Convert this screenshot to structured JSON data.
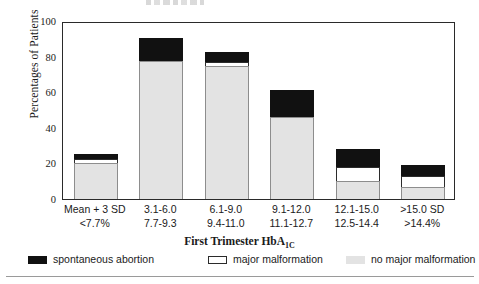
{
  "chart_data": {
    "type": "bar",
    "subtype": "stacked-bar",
    "title": "",
    "xlabel": "First Trimester HbA1C",
    "ylabel": "Percentages of Patients",
    "ylim": [
      0,
      100
    ],
    "yticks": [
      0,
      20,
      40,
      60,
      80,
      100
    ],
    "grid": false,
    "legend_position": "bottom",
    "categories": [
      "Mean + 3 SD <7.7%",
      "3.1-6.0 7.7-9.3",
      "6.1-9.0 9.4-11.0",
      "9.1-12.0 11.1-12.7",
      "12.1-15.0 12.5-14.4",
      ">15.0 SD >14.4%"
    ],
    "category_lines": [
      {
        "line1": "Mean + 3 SD",
        "line2": "<7.7%"
      },
      {
        "line1": "3.1-6.0",
        "line2": "7.7-9.3"
      },
      {
        "line1": "6.1-9.0",
        "line2": "9.4-11.0"
      },
      {
        "line1": "9.1-12.0",
        "line2": "11.1-12.7"
      },
      {
        "line1": "12.1-15.0",
        "line2": "12.5-14.4"
      },
      {
        "line1": ">15.0 SD",
        "line2": ">14.4%"
      }
    ],
    "series": [
      {
        "name": "no major malformation",
        "color": "#e3e3e3",
        "values": [
          20,
          77.5,
          75,
          46,
          10,
          7
        ]
      },
      {
        "name": "major malformation",
        "color": "#ffffff",
        "values": [
          2.5,
          0,
          2,
          0,
          8,
          6
        ]
      },
      {
        "name": "spontaneous abortion",
        "color": "#111111",
        "values": [
          3,
          13,
          5.5,
          15,
          10,
          6
        ]
      }
    ],
    "totals": [
      25.5,
      90.5,
      82.5,
      61,
      28,
      19
    ]
  },
  "axes": {
    "y_title": "Percentages of Patients",
    "y_tick_labels": [
      "100",
      "80",
      "60",
      "40",
      "20",
      "0"
    ],
    "x_title_main": "First Trimester HbA",
    "x_title_sub": "1C"
  },
  "legend": {
    "items": [
      {
        "label": "spontaneous abortion",
        "swatch": "black-swatch"
      },
      {
        "label": "major malformation",
        "swatch": "white-swatch"
      },
      {
        "label": "no major malformation",
        "swatch": "gray-swatch"
      }
    ]
  }
}
